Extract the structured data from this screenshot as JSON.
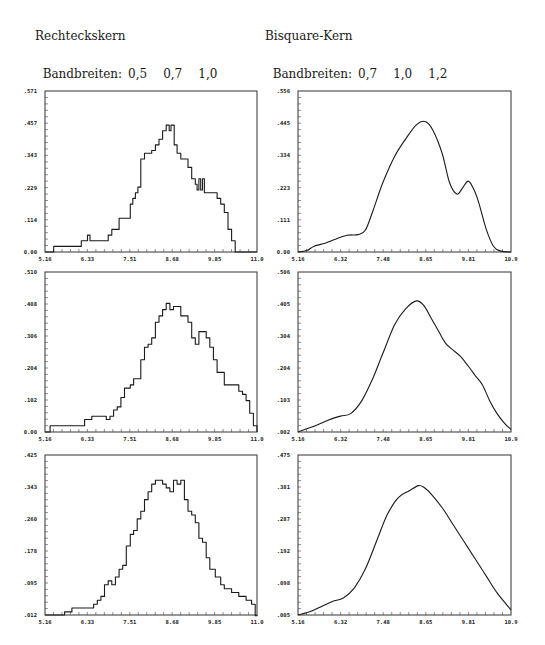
{
  "columns": [
    {
      "title": "Rechteckskern",
      "bandwidth_label": "Bandbreiten:",
      "bandwidths": [
        "0,5",
        "0,7",
        "1,0"
      ]
    },
    {
      "title": "Bisquare-Kern",
      "bandwidth_label": "Bandbreiten:",
      "bandwidths": [
        "0,7",
        "1,0",
        "1,2"
      ]
    }
  ],
  "chart_data": [
    {
      "type": "line",
      "step": true,
      "title": "Rechteckskern, Bandbreite 0,5",
      "xlabel": "",
      "ylabel": "",
      "xticks": [
        "5.16",
        "6.33",
        "7.51",
        "8.68",
        "9.85",
        "11.0"
      ],
      "yticks": [
        "0.00",
        ".114",
        ".229",
        ".343",
        ".457",
        ".571"
      ],
      "xlim": [
        5.16,
        11.0
      ],
      "ylim": [
        0.0,
        0.571
      ],
      "grid": false,
      "x": [
        5.16,
        5.4,
        5.55,
        5.7,
        5.85,
        6.0,
        6.16,
        6.2,
        6.33,
        6.4,
        6.5,
        6.6,
        6.7,
        6.8,
        6.9,
        7.0,
        7.1,
        7.2,
        7.3,
        7.4,
        7.51,
        7.58,
        7.65,
        7.72,
        7.8,
        7.9,
        8.0,
        8.1,
        8.2,
        8.3,
        8.4,
        8.5,
        8.58,
        8.63,
        8.68,
        8.72,
        8.8,
        8.9,
        9.0,
        9.1,
        9.2,
        9.3,
        9.35,
        9.4,
        9.45,
        9.5,
        9.55,
        9.6,
        9.7,
        9.8,
        9.9,
        10.0,
        10.1,
        10.2,
        10.3,
        10.4,
        10.5,
        10.6,
        10.7,
        11.0
      ],
      "values": [
        0.0,
        0.02,
        0.02,
        0.02,
        0.02,
        0.02,
        0.04,
        0.04,
        0.06,
        0.04,
        0.04,
        0.04,
        0.04,
        0.04,
        0.06,
        0.08,
        0.08,
        0.12,
        0.12,
        0.12,
        0.17,
        0.19,
        0.21,
        0.23,
        0.33,
        0.35,
        0.35,
        0.36,
        0.38,
        0.4,
        0.43,
        0.45,
        0.43,
        0.45,
        0.45,
        0.38,
        0.35,
        0.33,
        0.33,
        0.3,
        0.26,
        0.24,
        0.22,
        0.26,
        0.22,
        0.26,
        0.21,
        0.21,
        0.21,
        0.21,
        0.19,
        0.17,
        0.14,
        0.08,
        0.04,
        0.0,
        0.0,
        0.0,
        0.0,
        0.0
      ]
    },
    {
      "type": "line",
      "title": "Bisquare-Kern, Bandbreite 0,7",
      "xlabel": "",
      "ylabel": "",
      "xticks": [
        "5.16",
        "6.32",
        "7.48",
        "8.65",
        "9.81",
        "10.9"
      ],
      "yticks": [
        "0.00",
        ".111",
        ".223",
        ".334",
        ".445",
        ".556"
      ],
      "xlim": [
        5.16,
        10.98
      ],
      "ylim": [
        0.0,
        0.556
      ],
      "grid": false,
      "x": [
        5.16,
        5.4,
        5.6,
        5.9,
        6.2,
        6.5,
        6.8,
        7.0,
        7.2,
        7.48,
        7.8,
        8.1,
        8.4,
        8.65,
        8.85,
        9.1,
        9.3,
        9.5,
        9.65,
        9.81,
        9.95,
        10.1,
        10.3,
        10.5,
        10.7,
        10.98
      ],
      "values": [
        0.0,
        0.005,
        0.02,
        0.03,
        0.045,
        0.058,
        0.06,
        0.075,
        0.14,
        0.24,
        0.33,
        0.39,
        0.44,
        0.45,
        0.42,
        0.34,
        0.24,
        0.2,
        0.22,
        0.245,
        0.22,
        0.17,
        0.08,
        0.02,
        0.003,
        0.0
      ]
    },
    {
      "type": "line",
      "step": true,
      "title": "Rechteckskern, Bandbreite 0,7",
      "xlabel": "",
      "ylabel": "",
      "xticks": [
        "5.16",
        "6.33",
        "7.51",
        "8.68",
        "9.85",
        "11.0"
      ],
      "yticks": [
        "0.00",
        ".102",
        ".204",
        ".306",
        ".408",
        ".510"
      ],
      "xlim": [
        5.16,
        11.0
      ],
      "ylim": [
        0.0,
        0.51
      ],
      "grid": false,
      "x": [
        5.16,
        5.3,
        5.5,
        5.7,
        5.9,
        6.1,
        6.25,
        6.45,
        6.7,
        6.85,
        6.95,
        7.05,
        7.15,
        7.25,
        7.35,
        7.51,
        7.6,
        7.7,
        7.8,
        7.9,
        8.0,
        8.1,
        8.2,
        8.3,
        8.4,
        8.5,
        8.6,
        8.7,
        8.8,
        8.9,
        9.0,
        9.1,
        9.2,
        9.3,
        9.4,
        9.5,
        9.6,
        9.7,
        9.8,
        9.9,
        10.0,
        10.1,
        10.3,
        10.5,
        10.6,
        10.7,
        10.8,
        10.9,
        11.0
      ],
      "values": [
        0.0,
        0.02,
        0.02,
        0.02,
        0.02,
        0.02,
        0.04,
        0.05,
        0.05,
        0.04,
        0.05,
        0.07,
        0.08,
        0.11,
        0.14,
        0.15,
        0.17,
        0.17,
        0.23,
        0.27,
        0.28,
        0.3,
        0.35,
        0.37,
        0.39,
        0.41,
        0.39,
        0.4,
        0.4,
        0.37,
        0.37,
        0.35,
        0.3,
        0.28,
        0.32,
        0.32,
        0.3,
        0.27,
        0.23,
        0.19,
        0.19,
        0.15,
        0.15,
        0.13,
        0.12,
        0.1,
        0.06,
        0.02,
        0.0
      ]
    },
    {
      "type": "line",
      "title": "Bisquare-Kern, Bandbreite 1,0",
      "xlabel": "",
      "ylabel": "",
      "xticks": [
        "5.16",
        "6.32",
        "7.48",
        "8.65",
        "9.81",
        "10.9"
      ],
      "yticks": [
        ".002",
        ".103",
        ".204",
        ".304",
        ".405",
        ".506"
      ],
      "xlim": [
        5.16,
        10.98
      ],
      "ylim": [
        0.002,
        0.506
      ],
      "grid": false,
      "x": [
        5.16,
        5.4,
        5.7,
        6.0,
        6.32,
        6.6,
        6.9,
        7.2,
        7.48,
        7.8,
        8.1,
        8.4,
        8.6,
        8.8,
        9.0,
        9.2,
        9.4,
        9.6,
        9.81,
        10.0,
        10.2,
        10.4,
        10.6,
        10.8,
        10.98
      ],
      "values": [
        0.002,
        0.012,
        0.025,
        0.04,
        0.052,
        0.06,
        0.1,
        0.17,
        0.25,
        0.34,
        0.39,
        0.415,
        0.4,
        0.36,
        0.32,
        0.28,
        0.26,
        0.24,
        0.21,
        0.18,
        0.15,
        0.1,
        0.06,
        0.03,
        0.01
      ]
    },
    {
      "type": "line",
      "step": true,
      "title": "Rechteckskern, Bandbreite 1,0",
      "xlabel": "",
      "ylabel": "",
      "xticks": [
        "5.16",
        "6.33",
        "7.51",
        "8.68",
        "9.85",
        "11.0"
      ],
      "yticks": [
        ".012",
        ".095",
        ".178",
        ".260",
        ".343",
        ".425"
      ],
      "xlim": [
        5.16,
        11.0
      ],
      "ylim": [
        0.012,
        0.425
      ],
      "grid": false,
      "x": [
        5.16,
        5.7,
        5.9,
        6.1,
        6.33,
        6.5,
        6.6,
        6.7,
        6.8,
        6.9,
        7.0,
        7.1,
        7.2,
        7.3,
        7.4,
        7.51,
        7.6,
        7.7,
        7.8,
        7.9,
        8.0,
        8.1,
        8.2,
        8.4,
        8.5,
        8.6,
        8.7,
        8.8,
        8.9,
        9.0,
        9.1,
        9.2,
        9.3,
        9.4,
        9.5,
        9.6,
        9.7,
        9.85,
        10.0,
        10.1,
        10.3,
        10.5,
        10.7,
        10.85,
        10.95,
        11.0
      ],
      "values": [
        0.012,
        0.02,
        0.03,
        0.03,
        0.03,
        0.04,
        0.05,
        0.06,
        0.09,
        0.1,
        0.09,
        0.11,
        0.13,
        0.14,
        0.19,
        0.22,
        0.23,
        0.26,
        0.28,
        0.31,
        0.33,
        0.35,
        0.36,
        0.35,
        0.34,
        0.33,
        0.36,
        0.35,
        0.36,
        0.31,
        0.28,
        0.27,
        0.25,
        0.21,
        0.2,
        0.16,
        0.13,
        0.11,
        0.09,
        0.08,
        0.07,
        0.06,
        0.05,
        0.04,
        0.01,
        0.012
      ]
    },
    {
      "type": "line",
      "title": "Bisquare-Kern, Bandbreite 1,2",
      "xlabel": "",
      "ylabel": "",
      "xticks": [
        "5.16",
        "6.32",
        "7.48",
        "8.65",
        "9.81",
        "10.9"
      ],
      "yticks": [
        ".005",
        ".098",
        ".192",
        ".287",
        ".381",
        ".475"
      ],
      "xlim": [
        5.16,
        10.98
      ],
      "ylim": [
        0.005,
        0.475
      ],
      "grid": false,
      "x": [
        5.16,
        5.5,
        5.8,
        6.1,
        6.4,
        6.7,
        7.0,
        7.3,
        7.6,
        7.9,
        8.2,
        8.45,
        8.6,
        8.8,
        9.1,
        9.4,
        9.7,
        10.0,
        10.3,
        10.6,
        10.98
      ],
      "values": [
        0.005,
        0.015,
        0.03,
        0.045,
        0.055,
        0.085,
        0.14,
        0.22,
        0.3,
        0.35,
        0.37,
        0.385,
        0.38,
        0.36,
        0.32,
        0.27,
        0.22,
        0.17,
        0.12,
        0.07,
        0.02
      ]
    }
  ]
}
